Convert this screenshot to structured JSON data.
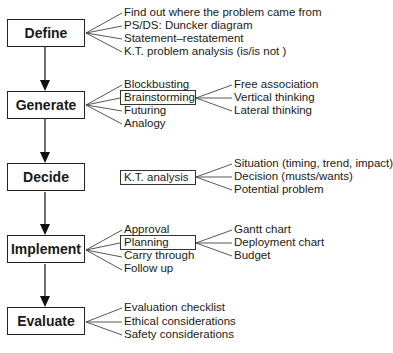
{
  "stages": [
    {
      "label": "Define"
    },
    {
      "label": "Generate"
    },
    {
      "label": "Decide"
    },
    {
      "label": "Implement"
    },
    {
      "label": "Evaluate"
    }
  ],
  "define": {
    "items": [
      "Find out where the problem came from",
      "PS/DS: Duncker diagram",
      "Statement–restatement",
      "K.T. problem analysis (is/is not )"
    ]
  },
  "generate": {
    "items": [
      "Blockbusting",
      "Brainstorming",
      "Futuring",
      "Analogy"
    ],
    "brainstorming_sub": [
      "Free association",
      "Vertical thinking",
      "Lateral thinking"
    ]
  },
  "decide": {
    "method": "K.T. analysis",
    "sub": [
      "Situation (timing, trend, impact)",
      "Decision (musts/wants)",
      "Potential problem"
    ]
  },
  "implement": {
    "items": [
      "Approval",
      "Planning",
      "Carry through",
      "Follow up"
    ],
    "planning_sub": [
      "Gantt chart",
      "Deployment chart",
      "Budget"
    ]
  },
  "evaluate": {
    "items": [
      "Evaluation checklist",
      "Ethical considerations",
      "Safety considerations"
    ]
  }
}
